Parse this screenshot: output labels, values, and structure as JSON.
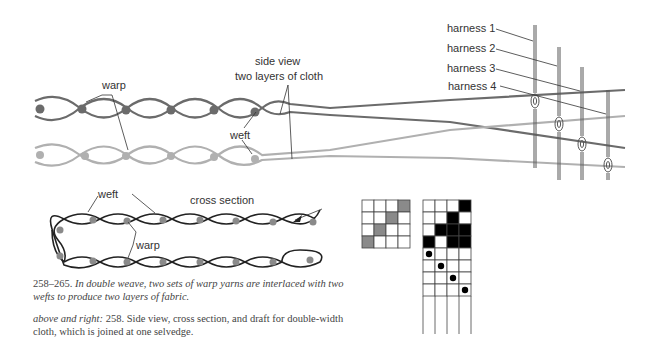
{
  "colors": {
    "upper_layer": "#6b6b6b",
    "lower_layer": "#b0b0b0",
    "draft_gray": "#8a8a8a",
    "draft_black": "#000000",
    "line": "#333333"
  },
  "side_view": {
    "labels": {
      "warp": "warp",
      "weft": "weft",
      "side_view": "side view",
      "two_layers": "two layers of cloth"
    },
    "harness_labels": [
      "harness 1",
      "harness 2",
      "harness 3",
      "harness 4"
    ]
  },
  "cross_section": {
    "labels": {
      "weft": "weft",
      "title": "cross section",
      "warp": "warp"
    }
  },
  "draft": {
    "tieup_small": [
      [
        0,
        0,
        0,
        1
      ],
      [
        0,
        0,
        1,
        0
      ],
      [
        0,
        1,
        0,
        0
      ],
      [
        1,
        0,
        0,
        0
      ]
    ],
    "tieup_large": [
      [
        0,
        0,
        0,
        1
      ],
      [
        0,
        0,
        1,
        0
      ],
      [
        0,
        1,
        1,
        1
      ],
      [
        1,
        0,
        1,
        1
      ]
    ],
    "treadling": [
      0,
      1,
      2,
      3
    ]
  },
  "captions": {
    "figure_number": "258–265.",
    "figure_text": "In double weave, two sets of warp yarns are interlaced with two wefts to produce two layers of fabric.",
    "ref_italic": "above and right:",
    "ref_text": "258. Side view, cross section, and draft for double-width cloth, which is joined at one selvedge."
  }
}
